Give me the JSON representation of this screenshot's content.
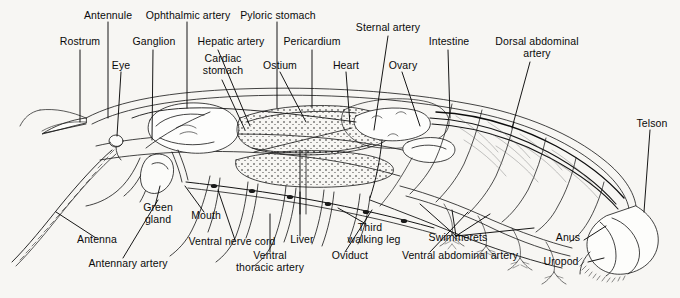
{
  "figure": {
    "background_color": "#f7f6f3",
    "ink_color": "#111111",
    "width": 680,
    "height": 298
  },
  "labels": {
    "antennule": "Antennule",
    "rostrum": "Rostrum",
    "eye": "Eye",
    "ganglion": "Ganglion",
    "ophthalmic_artery": "Ophthalmic artery",
    "hepatic_artery": "Hepatic artery",
    "cardiac_stomach_l1": "Cardiac",
    "cardiac_stomach_l2": "stomach",
    "pyloric_stomach": "Pyloric stomach",
    "ostium": "Ostium",
    "pericardium": "Pericardium",
    "heart": "Heart",
    "sternal_artery": "Sternal artery",
    "ovary": "Ovary",
    "intestine": "Intestine",
    "dorsal_abdominal_artery_l1": "Dorsal abdominal",
    "dorsal_abdominal_artery_l2": "artery",
    "telson": "Telson",
    "antenna": "Antenna",
    "antennary_artery": "Antennary artery",
    "green_gland_l1": "Green",
    "green_gland_l2": "gland",
    "mouth": "Mouth",
    "ventral_nerve_cord": "Ventral nerve cord",
    "ventral_thoracic_artery_l1": "Ventral",
    "ventral_thoracic_artery_l2": "thoracic artery",
    "liver": "Liver",
    "oviduct": "Oviduct",
    "third_walking_leg_l1": "Third",
    "third_walking_leg_l2": "walking leg",
    "ventral_abdominal_artery": "Ventral abdominal artery",
    "swimmerets": "Swimmerets",
    "anus": "Anus",
    "uropod": "Uropod"
  }
}
